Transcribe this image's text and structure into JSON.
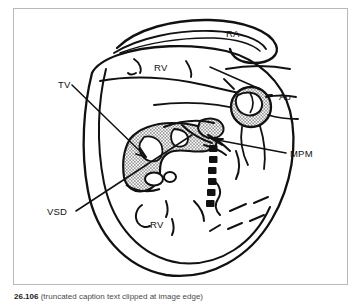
{
  "figure": {
    "frame_color": "#b9b9bb",
    "ink_color": "#111111",
    "background": "#ffffff",
    "labels": [
      {
        "id": "ra",
        "text": "RA",
        "x": 212,
        "y": 28,
        "name": "label-right-atrium"
      },
      {
        "id": "rv1",
        "text": "RV",
        "x": 140,
        "y": 62,
        "name": "label-right-ventricle-upper"
      },
      {
        "id": "ao",
        "text": "Ao",
        "x": 265,
        "y": 91,
        "name": "label-aorta"
      },
      {
        "id": "tv",
        "text": "TV",
        "x": 54,
        "y": 79,
        "name": "label-tricuspid-valve"
      },
      {
        "id": "mpm",
        "text": "MPM",
        "x": 272,
        "y": 142,
        "name": "label-medial-papillary-muscle"
      },
      {
        "id": "vsd",
        "text": "VSD",
        "x": 46,
        "y": 203,
        "name": "label-ventricular-septal-defect"
      },
      {
        "id": "rv2",
        "text": "RV",
        "x": 136,
        "y": 219,
        "name": "label-right-ventricle-lower"
      }
    ],
    "caption": {
      "number": "26.106",
      "text": "(truncated caption text clipped at image edge)"
    }
  }
}
